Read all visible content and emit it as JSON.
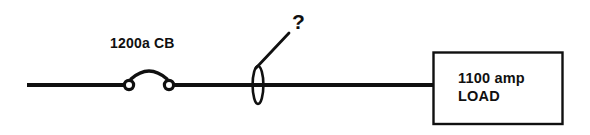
{
  "diagram": {
    "type": "electrical-one-line-diagram",
    "background_color": "#ffffff",
    "line_color": "#101010",
    "text_color": "#101010",
    "breaker": {
      "label": "1200a  CB",
      "rating_text": "1200a",
      "device_text": "CB",
      "symbol": "circuit-breaker"
    },
    "unknown_device": {
      "label": "?",
      "symbol": "fuse-ellipse"
    },
    "load": {
      "line1": "1100  amp",
      "line2": "LOAD",
      "symbol": "load-box"
    }
  }
}
